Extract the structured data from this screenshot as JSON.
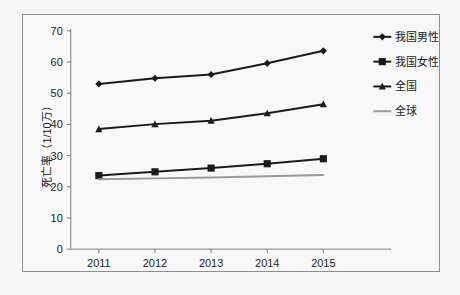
{
  "chart_data": {
    "type": "line",
    "title": "",
    "xlabel": "",
    "ylabel": "死亡率（1/10万）",
    "categories": [
      "2011",
      "2012",
      "2013",
      "2014",
      "2015"
    ],
    "x": [
      2011,
      2012,
      2013,
      2014,
      2015
    ],
    "ylim": [
      0,
      70
    ],
    "yticks": [
      0,
      10,
      20,
      30,
      40,
      50,
      60,
      70
    ],
    "ytick_labels": [
      "0",
      "10",
      "20",
      "30",
      "40",
      "50",
      "60",
      "70"
    ],
    "grid": false,
    "legend_position": "right",
    "series": [
      {
        "name": "我国男性",
        "values": [
          53.0,
          54.8,
          56.0,
          59.6,
          63.6
        ],
        "marker": "diamond",
        "color": "#1a1a1a",
        "line_width": 2
      },
      {
        "name": "我国女性",
        "values": [
          23.6,
          24.8,
          26.0,
          27.4,
          29.0
        ],
        "marker": "square",
        "color": "#1a1a1a",
        "line_width": 2
      },
      {
        "name": "全国",
        "values": [
          38.5,
          40.1,
          41.2,
          43.6,
          46.5
        ],
        "marker": "triangle",
        "color": "#1a1a1a",
        "line_width": 2
      },
      {
        "name": "全球",
        "values": [
          22.4,
          22.7,
          23.0,
          23.4,
          23.8
        ],
        "marker": "none",
        "color": "#9a9a9a",
        "line_width": 2
      }
    ]
  },
  "legend": {
    "items": [
      {
        "label": "我国男性",
        "marker": "diamond",
        "color": "#1a1a1a"
      },
      {
        "label": "我国女性",
        "marker": "square",
        "color": "#1a1a1a"
      },
      {
        "label": "全国",
        "marker": "triangle",
        "color": "#1a1a1a"
      },
      {
        "label": "全球",
        "marker": "none",
        "color": "#9a9a9a"
      }
    ]
  },
  "axis": {
    "y_title": "死亡率（1/10万）",
    "y_tick_labels": [
      "70",
      "60",
      "50",
      "40",
      "30",
      "20",
      "10",
      "0"
    ],
    "x_tick_labels": [
      "2011",
      "2012",
      "2013",
      "2014",
      "2015"
    ]
  }
}
